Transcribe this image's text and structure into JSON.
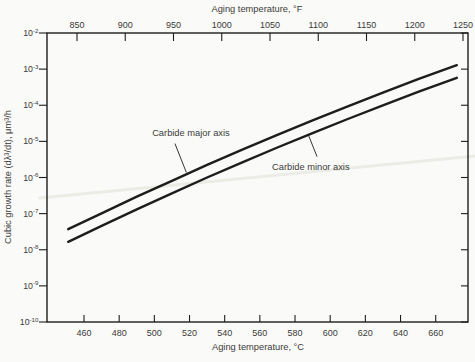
{
  "figure": {
    "background": "#fafaf8",
    "line_color": "#1d1d1b",
    "text_color": "#3a3a38",
    "artifact_color": "#ececе6"
  },
  "chart_data": {
    "type": "line",
    "title": "",
    "x_axis_top": {
      "label": "Aging temperature, °F",
      "unit": "°F",
      "ticks": [
        850,
        900,
        950,
        1000,
        1050,
        1100,
        1150,
        1200,
        1250
      ],
      "range": [
        819,
        1255
      ]
    },
    "x_axis_bottom": {
      "label": "Aging temperature, °C",
      "unit": "°C",
      "ticks": [
        460,
        480,
        500,
        520,
        540,
        560,
        580,
        600,
        620,
        640,
        660
      ],
      "range": [
        439,
        678
      ]
    },
    "y_axis": {
      "label": "Cubic growth rate (dλ³/dt), μm³/h",
      "scale": "log10",
      "tick_exponents": [
        -2,
        -3,
        -4,
        -5,
        -6,
        -7,
        -8,
        -9,
        -10
      ],
      "range_exponents": [
        -10,
        -2
      ],
      "grid": "off"
    },
    "legend": "none (inline annotations with leader lines)",
    "series": [
      {
        "name": "Carbide major axis",
        "x_c": [
          451,
          470,
          490,
          510,
          530,
          550,
          570,
          590,
          610,
          630,
          650,
          672
        ],
        "log10_rate": [
          -7.43,
          -6.99,
          -6.53,
          -6.09,
          -5.65,
          -5.23,
          -4.82,
          -4.42,
          -4.03,
          -3.65,
          -3.28,
          -2.89
        ]
      },
      {
        "name": "Carbide minor axis",
        "x_c": [
          451,
          470,
          490,
          510,
          530,
          550,
          570,
          590,
          610,
          630,
          650,
          672
        ],
        "log10_rate": [
          -7.78,
          -7.34,
          -6.88,
          -6.44,
          -6.0,
          -5.58,
          -5.17,
          -4.77,
          -4.38,
          -4.0,
          -3.63,
          -3.24
        ]
      }
    ],
    "annotations": [
      {
        "text": "Carbide major axis",
        "at_c": 520.8,
        "at_exp": -4.77,
        "leader_from_c": 511.7,
        "leader_from_exp": -5.06,
        "leader_to_c": 518.2,
        "leader_to_exp": -5.86
      },
      {
        "text": "Carbide minor axis",
        "at_c": 589.0,
        "at_exp": -5.7,
        "leader_from_c": 592.5,
        "leader_from_exp": -5.42,
        "leader_to_c": 587.4,
        "leader_to_exp": -4.8
      }
    ]
  }
}
